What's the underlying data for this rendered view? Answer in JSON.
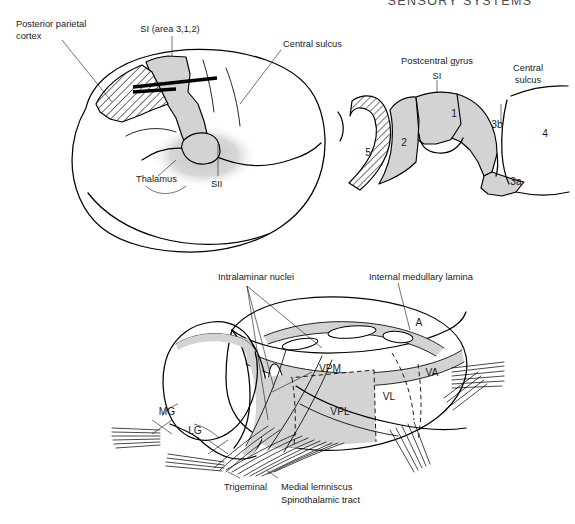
{
  "page": {
    "running_head": "SENSORY SYSTEMS",
    "background_color": "#ffffff",
    "ink_color": "#000000",
    "shade_color": "#d3d3d3",
    "width": 575,
    "height": 524
  },
  "panel_brain": {
    "name": "lateral view of cerebral hemisphere",
    "labels": {
      "posterior_parietal_cortex": "Posterior parietal\ncortex",
      "posterior_parietal_cortex_line1": "Posterior parietal",
      "posterior_parietal_cortex_line2": "cortex",
      "si_area": "SI (area 3,1,2)",
      "central_sulcus": "Central sulcus",
      "thalamus": "Thalamus",
      "sii": "SII"
    },
    "regions": [
      {
        "id": "posterior-parietal-cortex",
        "fill": "hatched"
      },
      {
        "id": "si-strip",
        "fill": "gray"
      },
      {
        "id": "thalamus-cloud",
        "fill": "stipple"
      },
      {
        "id": "sii-region",
        "fill": "gray"
      }
    ]
  },
  "panel_gyrus": {
    "name": "cross section through postcentral gyrus",
    "labels": {
      "postcentral_gyrus": "Postcentral gyrus",
      "si": "SI",
      "central_sulcus_line1": "Central",
      "central_sulcus_line2": "sulcus"
    },
    "areas": [
      {
        "label": "5",
        "fill": "hatched"
      },
      {
        "label": "2",
        "fill": "gray"
      },
      {
        "label": "1",
        "fill": "gray"
      },
      {
        "label": "3b",
        "fill": "gray"
      },
      {
        "label": "3a",
        "fill": "gray"
      },
      {
        "label": "4",
        "fill": "white"
      }
    ]
  },
  "panel_thalamus": {
    "name": "three-quarter view of the thalamus",
    "labels": {
      "intralaminar_nuclei": "Intralaminar nuclei",
      "internal_medullary_lamina": "Internal medullary lamina",
      "trigeminal": "Trigeminal",
      "medial_lemniscus": "Medial lemniscus",
      "spinothalamic_tract": "Spinothalamic tract"
    },
    "nuclei": [
      {
        "label": "A",
        "fill": "white"
      },
      {
        "label": "VPM",
        "fill": "white"
      },
      {
        "label": "VA",
        "fill": "white"
      },
      {
        "label": "VL",
        "fill": "white"
      },
      {
        "label": "VPL",
        "fill": "gray"
      },
      {
        "label": "MG",
        "fill": "white"
      },
      {
        "label": "LG",
        "fill": "white"
      }
    ]
  }
}
